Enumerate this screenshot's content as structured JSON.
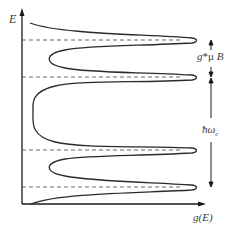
{
  "diagram": {
    "y_axis_label": "E",
    "x_axis_label": "g(E)",
    "zeeman_label": "g*μ B",
    "zeeman_label_parts": {
      "g": "g",
      "star_mu": "*μ ",
      "b": "B"
    },
    "cyclotron_label": "ħω",
    "cyclotron_subscript": "c",
    "colors": {
      "curve": "#2a2a2a",
      "axis": "#1a1a1a",
      "dashed": "#555555",
      "text": "#3a3a3a"
    },
    "levels_y_px": [
      40,
      77,
      150,
      187
    ],
    "peaks": 4
  }
}
